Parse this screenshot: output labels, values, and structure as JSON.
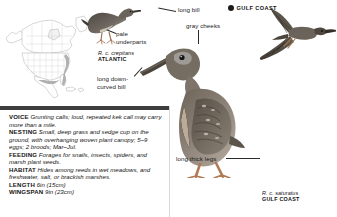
{
  "page": {
    "species": "Clapper Rail",
    "width": 337,
    "height": 217
  },
  "range_map": {
    "name": "north-america-range-map",
    "continent": "North America",
    "colors": {
      "land": "#ffffff",
      "outline": "#9a9a9a",
      "range": "#b9b9b9"
    }
  },
  "callouts": {
    "long_bill": "long bill",
    "pale_underparts": "pale\nunderparts",
    "long_down_curved_bill": "long down-\ncurved bill",
    "gray_cheeks": "gray cheeks",
    "long_thick_legs": "long thick legs"
  },
  "markers": {
    "gulf_coast_top": "GULF COAST"
  },
  "subspecies": {
    "atlantic": {
      "scientific": "R. c. crepitans",
      "region": "ATLANTIC"
    },
    "gulf": {
      "scientific": "R. c. saturatus",
      "region": "GULF COAST"
    }
  },
  "info_panel": {
    "rows": [
      {
        "term": "VOICE",
        "desc": "Grunting calls; loud, repeated kek call may carry more than a mile."
      },
      {
        "term": "NESTING",
        "desc": "Small, deep grass and sedge cup on the ground, with overhanging woven plant canopy; 5–9 eggs; 2 broods; Mar–Jul."
      },
      {
        "term": "FEEDING",
        "desc": "Forages for snails, insects, spiders, and marsh plant seeds."
      },
      {
        "term": "HABITAT",
        "desc": "Hides among reeds in wet meadows, and freshwater, salt, or brackish marshes."
      },
      {
        "term": "LENGTH",
        "desc": "6in (15cm)"
      },
      {
        "term": "WINGSPAN",
        "desc": "9in (23cm)"
      }
    ]
  }
}
